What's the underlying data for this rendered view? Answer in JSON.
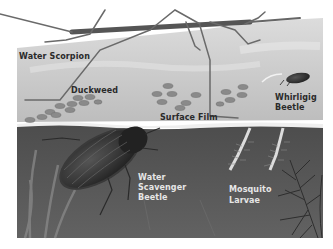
{
  "illustration": {
    "subject": "Pond surface and underwater insects",
    "colors": {
      "air": "#f4f4f4",
      "surface_water": "#c9c9c9",
      "surface_film_edge": "#ebebeb",
      "underwater": "#5a5a5a",
      "duckweed": "#8a8a8a",
      "beetle_dark": "#2b2b2b"
    },
    "labels": {
      "water_scorpion": "Water Scorpion",
      "duckweed": "Duckweed",
      "surface_film": "Surface Film",
      "whirligig_beetle_line1": "Whirligig",
      "whirligig_beetle_line2": "Beetle",
      "water_scavenger_line1": "Water",
      "water_scavenger_line2": "Scavenger",
      "water_scavenger_line3": "Beetle",
      "mosquito_line1": "Mosquito",
      "mosquito_line2": "Larvae"
    }
  }
}
